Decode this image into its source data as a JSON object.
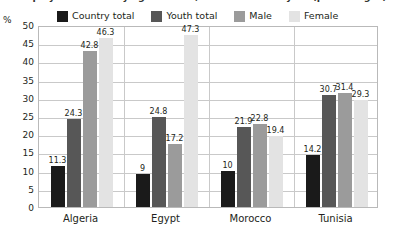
{
  "figure": {
    "title": "Unemployment rates by age and sex, latest available year (percentages)",
    "y_unit": "%"
  },
  "chart_data": {
    "type": "bar",
    "title": "Unemployment rates by age and sex, latest available year (percentages)",
    "xlabel": "",
    "ylabel": "%",
    "ylim": [
      0,
      50
    ],
    "ytick_step": 5,
    "yticks": [
      "50",
      "45",
      "40",
      "35",
      "30",
      "25",
      "20",
      "15",
      "10",
      "5",
      "0"
    ],
    "grid": true,
    "legend_position": "top",
    "categories": [
      "Algeria",
      "Egypt",
      "Morocco",
      "Tunisia"
    ],
    "series": [
      {
        "name": "Country total",
        "color": "#1a1a1a",
        "values": [
          11.3,
          9,
          10,
          14.2
        ],
        "labels": [
          "11.3",
          "9",
          "10",
          "14.2"
        ]
      },
      {
        "name": "Youth total",
        "color": "#575757",
        "values": [
          24.3,
          24.8,
          21.9,
          30.7
        ],
        "labels": [
          "24.3",
          "24.8",
          "21.9",
          "30.7"
        ]
      },
      {
        "name": "Male",
        "color": "#9b9b9b",
        "values": [
          42.8,
          17.2,
          22.8,
          31.4
        ],
        "labels": [
          "42.8",
          "17.2",
          "22.8",
          "31.4"
        ]
      },
      {
        "name": "Female",
        "color": "#e3e3e3",
        "values": [
          46.3,
          47.3,
          19.4,
          29.3
        ],
        "labels": [
          "46.3",
          "47.3",
          "19.4",
          "29.3"
        ]
      }
    ]
  }
}
